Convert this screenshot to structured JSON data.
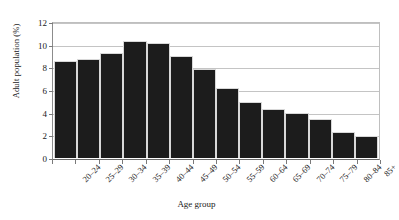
{
  "chart_data": {
    "type": "bar",
    "title": "",
    "xlabel": "Age group",
    "ylabel": "Adult population (%)",
    "categories": [
      "20–24",
      "25–29",
      "30–34",
      "35–39",
      "40–44",
      "45–49",
      "50–54",
      "55–59",
      "60–64",
      "65–69",
      "70–74",
      "75–79",
      "80–84",
      "85+"
    ],
    "values": [
      8.6,
      8.8,
      9.3,
      10.4,
      10.2,
      9.1,
      7.9,
      6.2,
      5.0,
      4.4,
      4.0,
      3.5,
      2.3,
      2.0
    ],
    "ylim": [
      0,
      12
    ],
    "yticks": [
      0,
      2,
      4,
      6,
      8,
      10,
      12
    ],
    "ytick_labels": [
      "0",
      "2",
      "4",
      "6",
      "8",
      "10",
      "12"
    ],
    "grid": true,
    "legend": false,
    "bar_color": "#1c1c1c",
    "grid_color": "#c4c4c4",
    "axis_color": "#6b6b6b",
    "background": "#ffffff"
  }
}
